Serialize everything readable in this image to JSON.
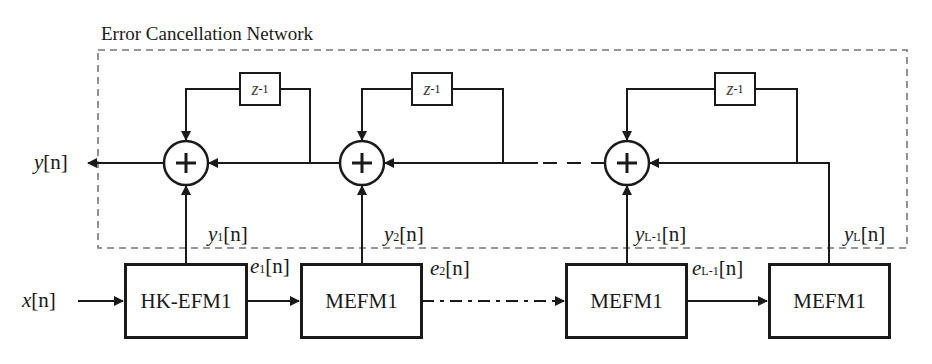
{
  "diagram": {
    "title": "Error Cancellation Network",
    "input_label": {
      "var": "x",
      "suffix": "[n]"
    },
    "output_label": {
      "var": "y",
      "suffix": "[n]"
    },
    "delay_label": {
      "var": "z",
      "exp": "-1"
    },
    "blocks": [
      {
        "label": "HK-EFM1"
      },
      {
        "label": "MEFM1"
      },
      {
        "label": "MEFM1"
      },
      {
        "label": "MEFM1"
      }
    ],
    "block_outputs": [
      {
        "var": "y",
        "sub": "1",
        "suffix": "[n]"
      },
      {
        "var": "y",
        "sub": "2",
        "suffix": "[n]"
      },
      {
        "var": "y",
        "sub": "L-1",
        "suffix": "[n]"
      },
      {
        "var": "y",
        "sub": "L",
        "suffix": "[n]"
      }
    ],
    "errors": [
      {
        "var": "e",
        "sub": "1",
        "suffix": "[n]"
      },
      {
        "var": "e",
        "sub": "2",
        "suffix": "[n]"
      },
      {
        "var": "e",
        "sub": "L-1",
        "suffix": "[n]"
      }
    ],
    "summer_symbol": "+"
  }
}
